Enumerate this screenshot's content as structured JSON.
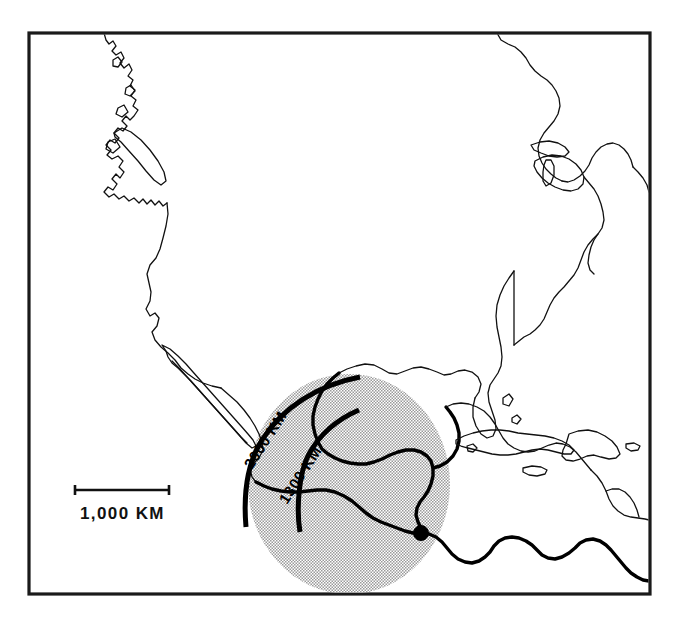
{
  "figure": {
    "kind": "reference-map",
    "width": 674,
    "height": 619,
    "background_color": "#ffffff",
    "frame": {
      "name": "map-neatline",
      "x": 29,
      "y": 33,
      "width": 621,
      "height": 561,
      "stroke_color": "#1a1a1a"
    }
  },
  "scale_bar": {
    "label": "1,000 KM",
    "bar_x1": 74,
    "bar_x2": 170,
    "bar_y": 490,
    "label_x": 80,
    "label_y": 519,
    "color": "#111111"
  },
  "distance_arcs": [
    {
      "label": "2000 KM",
      "radius_km": 2000,
      "label_x": 252,
      "label_y": 470,
      "label_rotation": -58,
      "color": "#000000"
    },
    {
      "label": "1300 KM",
      "radius_km": 1300,
      "label_x": 286,
      "label_y": 503,
      "label_rotation": -58,
      "color": "#000000"
    }
  ],
  "site_marker": {
    "name": "source-site-dot",
    "x": 421,
    "y": 533,
    "radius": 7.5,
    "color": "#000000"
  },
  "shaded_zone": {
    "name": "distribution-zone",
    "center_x": 349,
    "center_y": 484,
    "radius_x": 101,
    "radius_y": 110,
    "fill_color": "#d4d4d4",
    "pattern": "halftone-dot-screen"
  },
  "colors": {
    "ink": "#111111",
    "frame": "#1a1a1a",
    "shade": "#d4d4d4",
    "paper": "#ffffff"
  }
}
